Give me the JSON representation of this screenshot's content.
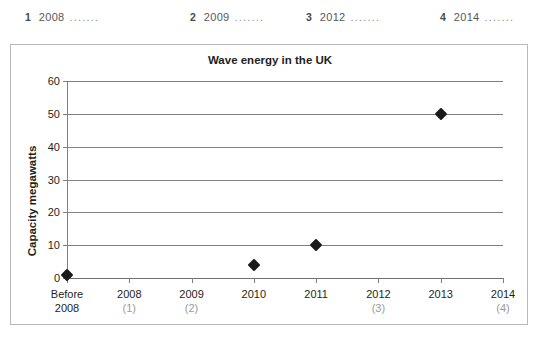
{
  "answers": {
    "dots": ".......",
    "items": [
      {
        "number": "1",
        "year": "2008",
        "left": 25
      },
      {
        "number": "2",
        "year": "2009",
        "left": 190
      },
      {
        "number": "3",
        "year": "2012",
        "left": 306
      },
      {
        "number": "4",
        "year": "2014",
        "left": 440
      }
    ]
  },
  "chart_data": {
    "type": "scatter",
    "title": "Wave energy in the UK",
    "xlabel": "",
    "ylabel": "Capacity megawatts",
    "ylim": [
      0,
      60
    ],
    "yticks": [
      0,
      10,
      20,
      30,
      40,
      50,
      60
    ],
    "ytick_labels": [
      "0",
      "10",
      "20",
      "30",
      "40",
      "50",
      "60"
    ],
    "grid": true,
    "legend": false,
    "categories": [
      "Before 2008",
      "2008",
      "2009",
      "2010",
      "2011",
      "2012",
      "2013",
      "2014"
    ],
    "category_sublabels": [
      "2008",
      "",
      "",
      "",
      "",
      "",
      "",
      ""
    ],
    "category_annotations": [
      "",
      "(1)",
      "(2)",
      "",
      "",
      "(3)",
      "",
      "(4)"
    ],
    "values": [
      1,
      null,
      null,
      4,
      10,
      null,
      50,
      null
    ],
    "points": [
      {
        "category": "Before 2008",
        "value": 1
      },
      {
        "category": "2010",
        "value": 4
      },
      {
        "category": "2011",
        "value": 10
      },
      {
        "category": "2013",
        "value": 50
      }
    ],
    "marker": "diamond",
    "marker_color": "#1a1a1a"
  },
  "colors": {
    "frame": "#b9b9bb",
    "grid": "#808082",
    "text": "#231f20",
    "muted": "#9a9a9c"
  }
}
